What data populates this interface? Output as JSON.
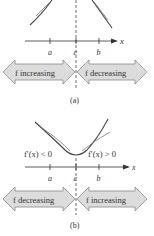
{
  "panel_a": {
    "axis_label": "x",
    "ticks": [
      "a",
      "c",
      "b"
    ],
    "left_arrow": "f increasing",
    "right_arrow": "f decreasing",
    "caption": "(a)"
  },
  "panel_b": {
    "axis_label": "x",
    "ticks": [
      "a",
      "c",
      "b"
    ],
    "left_derivative": "f′(x) < 0",
    "right_derivative": "f′(x) > 0",
    "left_arrow": "f decreasing",
    "right_arrow": "f increasing",
    "caption": "(b)"
  },
  "colors": {
    "arrow_fill": "#dcdcdc",
    "arrow_stroke": "#888888",
    "curve": "#444444",
    "axis": "#333333"
  }
}
